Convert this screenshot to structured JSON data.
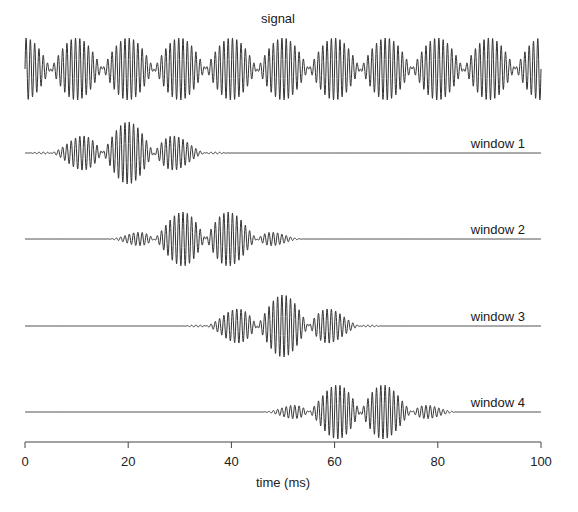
{
  "chart_data": {
    "type": "line",
    "title": "signal",
    "xlabel": "time (ms)",
    "ylabel": "",
    "xlim": [
      0,
      100
    ],
    "x_ticks": [
      0,
      20,
      40,
      60,
      80,
      100
    ],
    "x_tick_labels": [
      "0",
      "20",
      "40",
      "60",
      "80",
      "100"
    ],
    "grid": false,
    "legend": "none",
    "signal": {
      "description": "amplitude-modulated tone (beating), envelope |cos| with 10 ms period",
      "envelope_period_ms": 10,
      "envelope_peaks_ms": [
        5,
        15,
        25,
        35,
        45,
        55,
        65,
        75,
        85,
        95
      ],
      "carrier_cycles_per_ms": 1.2,
      "amplitude": 1.0
    },
    "series": [
      {
        "name": "signal",
        "window_center_ms": null,
        "window_length_ms": null
      },
      {
        "name": "window 1",
        "window_center_ms": 20,
        "window_length_ms": 40,
        "window_type": "hann"
      },
      {
        "name": "window 2",
        "window_center_ms": 35,
        "window_length_ms": 40,
        "window_type": "hann"
      },
      {
        "name": "window 3",
        "window_center_ms": 50,
        "window_length_ms": 40,
        "window_type": "hann"
      },
      {
        "name": "window 4",
        "window_center_ms": 65,
        "window_length_ms": 40,
        "window_type": "hann"
      }
    ],
    "hop_ms": 15
  },
  "labels": {
    "title": "signal",
    "xlabel": "time (ms)",
    "windows": [
      "window 1",
      "window 2",
      "window 3",
      "window 4"
    ],
    "ticks": [
      "0",
      "20",
      "40",
      "60",
      "80",
      "100"
    ]
  },
  "layout": {
    "x0_px": 25,
    "x1_px": 541,
    "trace_baselines_px": [
      69,
      153,
      239,
      326,
      412
    ],
    "amplitude_px": 31,
    "axis_y_px": 442,
    "trace_color": "#333333",
    "axis_color": "#444444"
  }
}
